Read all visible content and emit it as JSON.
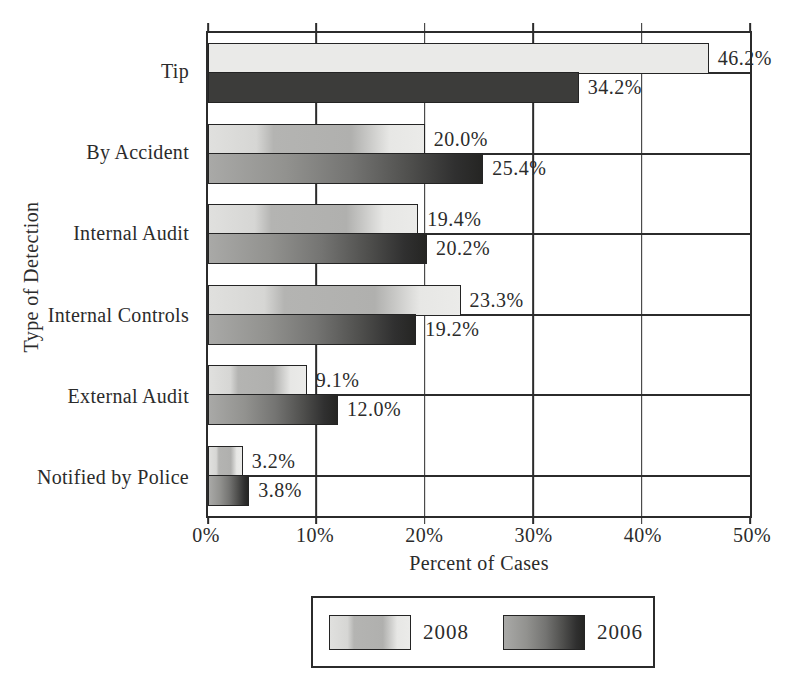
{
  "chart_data": {
    "type": "bar",
    "orientation": "horizontal",
    "categories": [
      "Tip",
      "By Accident",
      "Internal Audit",
      "Internal Controls",
      "External Audit",
      "Notified by Police"
    ],
    "series": [
      {
        "name": "2008",
        "values": [
          46.2,
          20.0,
          19.4,
          23.3,
          9.1,
          3.2
        ],
        "labels": [
          "46.2%",
          "20.0%",
          "19.4%",
          "23.3%",
          "9.1%",
          "3.2%"
        ]
      },
      {
        "name": "2006",
        "values": [
          34.2,
          25.4,
          20.2,
          19.2,
          12.0,
          3.8
        ],
        "labels": [
          "34.2%",
          "25.4%",
          "20.2%",
          "19.2%",
          "12.0%",
          "3.8%"
        ]
      }
    ],
    "xlabel": "Percent of Cases",
    "ylabel": "Type of Detection",
    "xlim": [
      0,
      50
    ],
    "xticks": [
      "0%",
      "10%",
      "20%",
      "30%",
      "40%",
      "50%"
    ],
    "grid": "vertical major gridlines every 10%; horizontal line at each category midline; outside tick marks top and bottom",
    "legend_position": "bottom-center, boxed"
  },
  "colors": {
    "background": "#ffffff",
    "line": "#2b2b2b",
    "text": "#2b2b2b",
    "bar_2008_gradient": "linear-gradient(90deg,#e0e0de 0%,#d6d6d4 22%,#b4b4b2 30%,#b0b0ae 66%,#c8c8c6 74%,#e7e7e5 84%,#ebebe9 100%)",
    "bar_2006_gradient": "linear-gradient(90deg,#a9a9a7 0%,#92928f 28%,#747472 52%,#4e4e4c 74%,#303030 90%,#252523 100%)",
    "tip_2008_fill": "#eaeae8",
    "tip_2006_fill": "#3c3c3a"
  }
}
